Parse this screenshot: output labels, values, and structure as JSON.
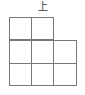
{
  "view_label": "上",
  "grid": {
    "rows": [
      {
        "cells": [
          1,
          1,
          0
        ]
      },
      {
        "cells": [
          1,
          1,
          1
        ]
      },
      {
        "cells": [
          1,
          1,
          1
        ]
      }
    ],
    "line_color": "#777777"
  }
}
